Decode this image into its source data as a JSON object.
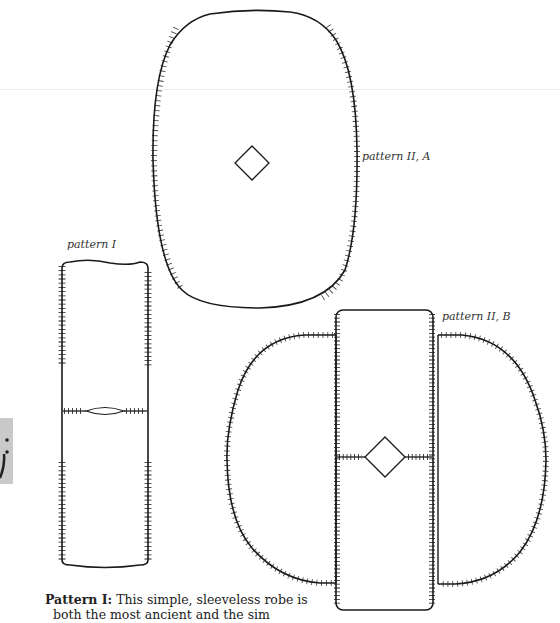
{
  "figure": {
    "labels": {
      "pattern_1": "pattern I",
      "pattern_2a": "pattern II, A",
      "pattern_2b": "pattern II, B"
    },
    "caption": {
      "title": "Pattern I:",
      "line1": " This simple, sleeveless robe is",
      "line2": "both the most ancient and the sim"
    },
    "colors": {
      "line": "#1a1a1a",
      "background": "#ffffff",
      "side_tab": "#c9c9c9"
    }
  }
}
